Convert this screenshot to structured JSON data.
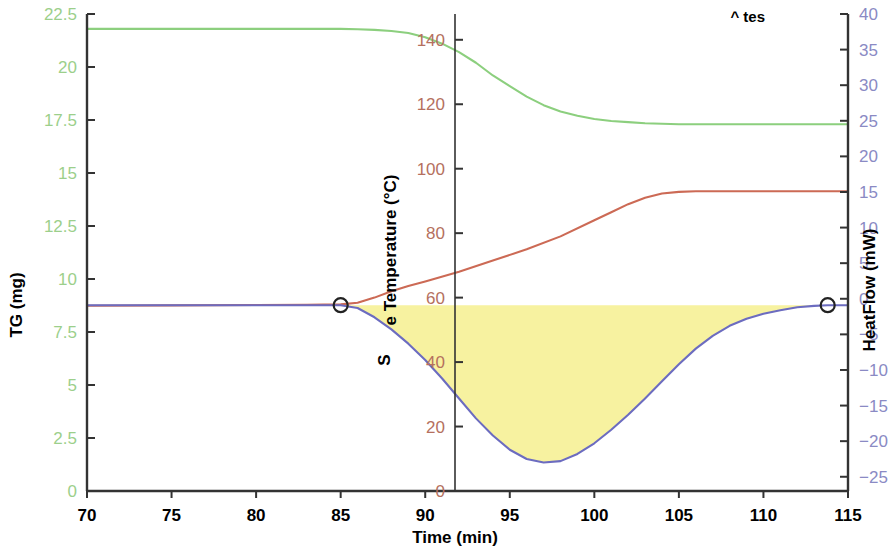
{
  "chart_data": {
    "type": "line",
    "title": "",
    "xlabel": "Time (min)",
    "xlim": [
      70,
      115
    ],
    "xticks": [
      70,
      75,
      80,
      85,
      90,
      95,
      100,
      105,
      110,
      115
    ],
    "grid": false,
    "legend": "none",
    "axes": [
      {
        "id": "tg",
        "label": "TG (mg)",
        "position": "left",
        "color": "#9ccf8b",
        "lim": [
          0,
          22.5
        ],
        "ticks": [
          0,
          2.5,
          5,
          7.5,
          10,
          12.5,
          15,
          17.5,
          20,
          22.5
        ],
        "ticklabels": [
          "0",
          "2.5",
          "5",
          "7.5",
          "10",
          "12.5",
          "15",
          "17.5",
          "20",
          "22.5"
        ]
      },
      {
        "id": "temperature",
        "label": "e Temperature (°C)",
        "label_extra": "S",
        "position": "middle",
        "color": "#b5705e",
        "lim": [
          0,
          148
        ],
        "ticks": [
          0,
          20,
          40,
          60,
          80,
          100,
          120,
          140
        ],
        "ticklabels": [
          "0",
          "20",
          "40",
          "60",
          "80",
          "100",
          "120",
          "140"
        ]
      },
      {
        "id": "heatflow",
        "label": "HeatFlow (mW)",
        "position": "right",
        "color": "#8a8ac4",
        "lim": [
          -27,
          40
        ],
        "ticks": [
          -25,
          -20,
          -15,
          -10,
          -5,
          0,
          5,
          10,
          15,
          20,
          25,
          30,
          35,
          40
        ],
        "ticklabels": [
          "−25",
          "−20",
          "−15",
          "−10",
          "−5",
          "0",
          "5",
          "10",
          "15",
          "20",
          "25",
          "30",
          "35",
          "40"
        ]
      }
    ],
    "clipped_annotation": "^  tes",
    "fill_region": {
      "name": "integrated-peak-area",
      "color": "#f7f2a0",
      "series": "heatflow",
      "baseline_from": [
        85.0,
        -0.9
      ],
      "baseline_to": [
        113.8,
        -0.9
      ]
    },
    "markers": [
      {
        "series": "heatflow",
        "x": 85.0,
        "y": -0.9,
        "shape": "circle"
      },
      {
        "series": "heatflow",
        "x": 113.8,
        "y": -0.9,
        "shape": "circle"
      }
    ],
    "series": [
      {
        "name": "TG",
        "axis": "tg",
        "color": "#8ccf7e",
        "unit": "mg",
        "x": [
          70,
          72,
          74,
          76,
          78,
          80,
          82,
          84,
          85,
          86,
          87,
          88,
          89,
          90,
          91,
          92,
          93,
          94,
          95,
          96,
          97,
          98,
          99,
          100,
          101,
          102,
          103,
          104,
          105,
          106,
          107,
          108,
          109,
          110,
          112,
          115
        ],
        "values": [
          21.8,
          21.8,
          21.8,
          21.8,
          21.8,
          21.8,
          21.8,
          21.8,
          21.8,
          21.78,
          21.75,
          21.7,
          21.6,
          21.4,
          21.1,
          20.7,
          20.2,
          19.6,
          19.1,
          18.6,
          18.2,
          17.9,
          17.7,
          17.55,
          17.45,
          17.4,
          17.35,
          17.32,
          17.3,
          17.3,
          17.3,
          17.3,
          17.3,
          17.3,
          17.3,
          17.3
        ]
      },
      {
        "name": "Sample Temperature",
        "axis": "temperature",
        "color": "#cc6a55",
        "unit": "°C",
        "x": [
          70,
          75,
          80,
          83,
          85,
          86,
          87,
          88,
          89,
          90,
          92,
          94,
          96,
          98,
          100,
          101,
          102,
          103,
          104,
          105,
          106,
          108,
          110,
          112,
          115
        ],
        "values": [
          57.5,
          57.6,
          57.7,
          57.8,
          57.9,
          58.4,
          60.0,
          62.0,
          63.6,
          65.0,
          68.0,
          71.5,
          75.0,
          79.0,
          84.0,
          86.5,
          89.0,
          91.0,
          92.3,
          92.8,
          93.0,
          93.0,
          93.0,
          93.0,
          93.0
        ]
      },
      {
        "name": "HeatFlow",
        "axis": "heatflow",
        "color": "#6c6cc0",
        "unit": "mW",
        "x": [
          70,
          75,
          80,
          84,
          85,
          86,
          87,
          88,
          89,
          90,
          91,
          92,
          93,
          94,
          95,
          96,
          97,
          98,
          99,
          100,
          101,
          102,
          103,
          104,
          105,
          106,
          107,
          108,
          109,
          110,
          111,
          112,
          113,
          113.8,
          115
        ],
        "values": [
          -0.9,
          -0.9,
          -0.9,
          -0.9,
          -0.9,
          -1.3,
          -2.6,
          -4.3,
          -6.3,
          -8.6,
          -11.2,
          -14.0,
          -16.8,
          -19.2,
          -21.2,
          -22.5,
          -23.0,
          -22.8,
          -21.8,
          -20.3,
          -18.4,
          -16.3,
          -14.0,
          -11.6,
          -9.2,
          -7.0,
          -5.2,
          -3.8,
          -2.8,
          -2.1,
          -1.6,
          -1.2,
          -1.0,
          -0.9,
          -0.9
        ]
      }
    ]
  }
}
